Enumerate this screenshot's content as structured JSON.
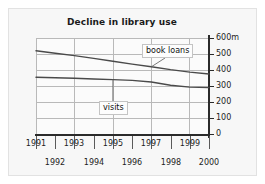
{
  "chart_data": {
    "type": "line",
    "title": "Decline in library use",
    "xlabel": "",
    "ylabel": "",
    "unit_suffix": "m",
    "grid": true,
    "legend_position": "inline-callouts",
    "xlim": [
      1991,
      2000
    ],
    "ylim": [
      0,
      600
    ],
    "yticks": [
      0,
      100,
      200,
      300,
      400,
      500,
      600
    ],
    "ytick_labels": [
      "0",
      "100",
      "200",
      "300",
      "400",
      "500",
      "600m"
    ],
    "x": [
      1991,
      1992,
      1993,
      1994,
      1995,
      1996,
      1997,
      1998,
      1999,
      2000
    ],
    "xtick_labels_top": [
      "1991",
      "1993",
      "1995",
      "1997",
      "1999"
    ],
    "xtick_labels_bottom": [
      "1992",
      "1994",
      "1996",
      "1998",
      "2000"
    ],
    "series": [
      {
        "name": "book loans",
        "values": [
          520,
          505,
          490,
          473,
          455,
          437,
          420,
          402,
          387,
          375
        ],
        "color": "#4a4a4a"
      },
      {
        "name": "visits",
        "values": [
          355,
          352,
          348,
          344,
          340,
          335,
          325,
          305,
          293,
          290
        ],
        "color": "#4a4a4a"
      }
    ],
    "annotations": [
      {
        "label": "book loans",
        "points_to_series": "book loans",
        "at_x": 1997
      },
      {
        "label": "visits",
        "points_to_series": "visits",
        "at_x": 1995
      }
    ]
  },
  "axis": {
    "y_labels": [
      "600m",
      "500",
      "400",
      "300",
      "200",
      "100",
      "0"
    ],
    "x_labels_top": [
      "1991",
      "1993",
      "1995",
      "1997",
      "1999"
    ],
    "x_labels_bottom": [
      "1992",
      "1994",
      "1996",
      "1998",
      "2000"
    ]
  },
  "callouts": {
    "book_loans": "book loans",
    "visits": "visits"
  },
  "colors": {
    "line": "#4a4a4a",
    "axis": "#2b2b2b",
    "grid": "#b9b9b9",
    "background": "#f7f7f7",
    "plot_background": "#fbfbfb"
  }
}
